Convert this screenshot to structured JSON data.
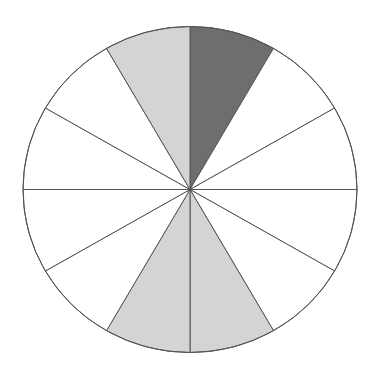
{
  "diagram": {
    "type": "fraction-circle",
    "sectors_total": 12,
    "center": [
      190,
      189.5
    ],
    "rx": 167,
    "ry": 163,
    "stroke_color": "#555555",
    "colors": {
      "background": "#ffffff",
      "dark": "#6e6e6e",
      "light": "#d4d4d4",
      "empty": "#ffffff"
    },
    "sectors": [
      {
        "index": 0,
        "start_deg": 90,
        "end_deg": 60,
        "fill": "dark"
      },
      {
        "index": 1,
        "start_deg": 60,
        "end_deg": 30,
        "fill": "empty"
      },
      {
        "index": 2,
        "start_deg": 30,
        "end_deg": 0,
        "fill": "empty"
      },
      {
        "index": 3,
        "start_deg": 0,
        "end_deg": -30,
        "fill": "empty"
      },
      {
        "index": 4,
        "start_deg": -30,
        "end_deg": -60,
        "fill": "empty"
      },
      {
        "index": 5,
        "start_deg": -60,
        "end_deg": -90,
        "fill": "light"
      },
      {
        "index": 6,
        "start_deg": -90,
        "end_deg": -120,
        "fill": "light"
      },
      {
        "index": 7,
        "start_deg": -120,
        "end_deg": -150,
        "fill": "empty"
      },
      {
        "index": 8,
        "start_deg": -150,
        "end_deg": -180,
        "fill": "empty"
      },
      {
        "index": 9,
        "start_deg": 180,
        "end_deg": 150,
        "fill": "empty"
      },
      {
        "index": 10,
        "start_deg": 150,
        "end_deg": 120,
        "fill": "empty"
      },
      {
        "index": 11,
        "start_deg": 120,
        "end_deg": 90,
        "fill": "light"
      }
    ]
  }
}
